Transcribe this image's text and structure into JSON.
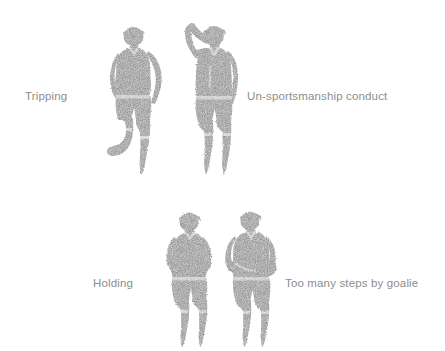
{
  "page": {
    "background_color": "#ffffff",
    "width": 445,
    "height": 351,
    "figure_color": "#8a8a8a",
    "caption_color": "#8d8d8d"
  },
  "captions": {
    "tripping": "Tripping",
    "unsportsmanship": "Un-sportsmanship conduct",
    "holding": "Holding",
    "goalie": "Too many steps by goalie"
  },
  "figures": [
    {
      "id": "tripping",
      "icon": "referee-tripping-signal-icon",
      "description": "Standing referee figure with one leg raised and bent backward"
    },
    {
      "id": "unsportsmanship",
      "icon": "referee-unsportsmanship-signal-icon",
      "description": "Standing referee figure with one hand raised to the head"
    },
    {
      "id": "holding",
      "icon": "referee-holding-signal-icon",
      "description": "Standing referee figure with one arm extended forward across the body"
    },
    {
      "id": "goalie",
      "icon": "referee-too-many-steps-signal-icon",
      "description": "Standing referee figure with both arms folded holding a ball at the chest"
    }
  ]
}
